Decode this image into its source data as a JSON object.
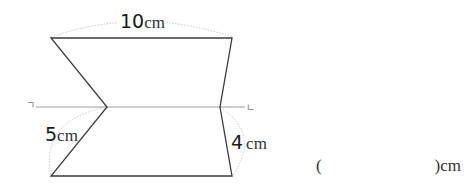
{
  "figure": {
    "top_length": {
      "value": "10",
      "unit": "cm"
    },
    "left_segment": {
      "value": "5",
      "unit": "cm"
    },
    "right_segment": {
      "value": "4",
      "unit": "cm"
    },
    "fold_line": {
      "left_marker": "ㄱ",
      "right_marker": "ㄴ"
    },
    "colors": {
      "outline": "#3a3a3a",
      "fold_line": "#9a9a9a",
      "measure_arc": "#c8c8c8"
    }
  },
  "answer": {
    "open_paren": "(",
    "blank": "",
    "close_paren_unit": ")cm"
  }
}
